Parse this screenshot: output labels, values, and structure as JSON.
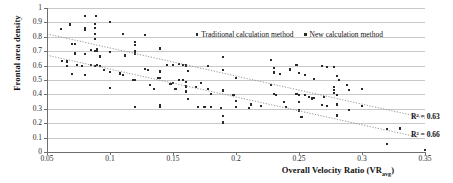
{
  "chart_data": {
    "type": "scatter",
    "title": "",
    "xlabel": "Overall Velocity Ratio (VR",
    "xlabel_sub": "avg",
    "xlabel_tail": ")",
    "ylabel": "Frontal area density",
    "xlim": [
      0.05,
      0.35
    ],
    "ylim": [
      0,
      1
    ],
    "xticks": [
      0.05,
      0.1,
      0.15,
      0.2,
      0.25,
      0.3,
      0.35
    ],
    "xtick_labels": [
      "0.05",
      "0.1",
      "0.15",
      "0.2",
      "0.25",
      "0.3",
      "0.35"
    ],
    "yticks": [
      0,
      0.1,
      0.2,
      0.3,
      0.4,
      0.5,
      0.6,
      0.7,
      0.8,
      0.9,
      1
    ],
    "ytick_labels": [
      "0",
      "0.1",
      "0.2",
      "0.3",
      "0.4",
      "0.5",
      "0.6",
      "0.7",
      "0.8",
      "0.9",
      "1"
    ],
    "grid": "horizontal",
    "legend_position": "top-center",
    "marker_color": "#2a2a2a",
    "gridline_color": "#c8c8c8",
    "trendline_color": "#8a8a8a",
    "series": [
      {
        "name": "Traditional calculation method",
        "marker": "square",
        "trendline": {
          "style": "dotted",
          "x_start": 0.05,
          "y_start": 0.82,
          "x_end": 0.35,
          "y_end": 0.235,
          "r_squared_label": "R² = 0.63",
          "r_squared": 0.63
        },
        "points": [
          [
            0.061,
            0.855
          ],
          [
            0.066,
            0.628
          ],
          [
            0.068,
            0.885
          ],
          [
            0.07,
            0.75
          ],
          [
            0.072,
            0.749
          ],
          [
            0.074,
            0.603
          ],
          [
            0.08,
            0.945
          ],
          [
            0.08,
            0.86
          ],
          [
            0.08,
            0.851
          ],
          [
            0.08,
            0.678
          ],
          [
            0.085,
            0.709
          ],
          [
            0.088,
            0.888
          ],
          [
            0.088,
            0.862
          ],
          [
            0.088,
            0.82
          ],
          [
            0.088,
            0.785
          ],
          [
            0.089,
            0.944
          ],
          [
            0.09,
            0.718
          ],
          [
            0.09,
            0.704
          ],
          [
            0.092,
            0.663
          ],
          [
            0.1,
            0.9
          ],
          [
            0.1,
            0.695
          ],
          [
            0.11,
            0.818
          ],
          [
            0.112,
            0.67
          ],
          [
            0.12,
            0.762
          ],
          [
            0.12,
            0.745
          ],
          [
            0.12,
            0.702
          ],
          [
            0.12,
            0.688
          ],
          [
            0.12,
            0.679
          ],
          [
            0.128,
            0.812
          ],
          [
            0.14,
            0.725
          ],
          [
            0.14,
            0.713
          ],
          [
            0.145,
            0.604
          ],
          [
            0.15,
            0.603
          ],
          [
            0.155,
            0.611
          ],
          [
            0.158,
            0.606
          ],
          [
            0.16,
            0.605
          ],
          [
            0.16,
            0.6
          ],
          [
            0.162,
            0.563
          ],
          [
            0.178,
            0.596
          ],
          [
            0.19,
            0.66
          ],
          [
            0.19,
            0.572
          ],
          [
            0.2,
            0.513
          ],
          [
            0.228,
            0.64
          ],
          [
            0.23,
            0.586
          ],
          [
            0.23,
            0.552
          ],
          [
            0.235,
            0.543
          ],
          [
            0.243,
            0.573
          ],
          [
            0.248,
            0.604
          ],
          [
            0.25,
            0.548
          ],
          [
            0.255,
            0.536
          ],
          [
            0.262,
            0.505
          ],
          [
            0.268,
            0.595
          ],
          [
            0.272,
            0.588
          ],
          [
            0.278,
            0.59
          ],
          [
            0.28,
            0.53
          ],
          [
            0.282,
            0.498
          ],
          [
            0.288,
            0.466
          ],
          [
            0.29,
            0.432
          ],
          [
            0.3,
            0.437
          ]
        ]
      },
      {
        "name": "New calculation method",
        "marker": "square",
        "trendline": {
          "style": "dotted",
          "x_start": 0.05,
          "y_start": 0.672,
          "x_end": 0.345,
          "y_end": 0.102,
          "r_squared_label": "R² = 0.66",
          "r_squared": 0.66
        },
        "points": [
          [
            0.062,
            0.63
          ],
          [
            0.066,
            0.6
          ],
          [
            0.07,
            0.748
          ],
          [
            0.07,
            0.542
          ],
          [
            0.072,
            0.684
          ],
          [
            0.078,
            0.596
          ],
          [
            0.08,
            0.535
          ],
          [
            0.085,
            0.604
          ],
          [
            0.088,
            0.702
          ],
          [
            0.088,
            0.6
          ],
          [
            0.09,
            0.7
          ],
          [
            0.09,
            0.604
          ],
          [
            0.092,
            0.6
          ],
          [
            0.095,
            0.572
          ],
          [
            0.1,
            0.557
          ],
          [
            0.1,
            0.445
          ],
          [
            0.108,
            0.545
          ],
          [
            0.11,
            0.535
          ],
          [
            0.118,
            0.5
          ],
          [
            0.12,
            0.688
          ],
          [
            0.12,
            0.5
          ],
          [
            0.12,
            0.498
          ],
          [
            0.12,
            0.312
          ],
          [
            0.128,
            0.575
          ],
          [
            0.13,
            0.568
          ],
          [
            0.132,
            0.463
          ],
          [
            0.135,
            0.436
          ],
          [
            0.138,
            0.515
          ],
          [
            0.14,
            0.562
          ],
          [
            0.14,
            0.555
          ],
          [
            0.14,
            0.513
          ],
          [
            0.14,
            0.325
          ],
          [
            0.14,
            0.312
          ],
          [
            0.148,
            0.47
          ],
          [
            0.15,
            0.478
          ],
          [
            0.152,
            0.436
          ],
          [
            0.155,
            0.502
          ],
          [
            0.158,
            0.5
          ],
          [
            0.16,
            0.485
          ],
          [
            0.16,
            0.455
          ],
          [
            0.16,
            0.42
          ],
          [
            0.162,
            0.368
          ],
          [
            0.168,
            0.452
          ],
          [
            0.17,
            0.31
          ],
          [
            0.172,
            0.478
          ],
          [
            0.175,
            0.312
          ],
          [
            0.178,
            0.438
          ],
          [
            0.18,
            0.405
          ],
          [
            0.18,
            0.312
          ],
          [
            0.188,
            0.307
          ],
          [
            0.19,
            0.427
          ],
          [
            0.19,
            0.252
          ],
          [
            0.19,
            0.205
          ],
          [
            0.198,
            0.398
          ],
          [
            0.2,
            0.355
          ],
          [
            0.2,
            0.312
          ],
          [
            0.21,
            0.303
          ],
          [
            0.212,
            0.33
          ],
          [
            0.22,
            0.318
          ],
          [
            0.228,
            0.467
          ],
          [
            0.23,
            0.402
          ],
          [
            0.232,
            0.398
          ],
          [
            0.238,
            0.345
          ],
          [
            0.24,
            0.312
          ],
          [
            0.248,
            0.403
          ],
          [
            0.25,
            0.395
          ],
          [
            0.25,
            0.345
          ],
          [
            0.25,
            0.29
          ],
          [
            0.25,
            0.282
          ],
          [
            0.252,
            0.243
          ],
          [
            0.255,
            0.398
          ],
          [
            0.258,
            0.382
          ],
          [
            0.26,
            0.375
          ],
          [
            0.26,
            0.37
          ],
          [
            0.262,
            0.375
          ],
          [
            0.268,
            0.325
          ],
          [
            0.27,
            0.382
          ],
          [
            0.272,
            0.318
          ],
          [
            0.278,
            0.452
          ],
          [
            0.278,
            0.428
          ],
          [
            0.278,
            0.412
          ],
          [
            0.28,
            0.395
          ],
          [
            0.28,
            0.33
          ],
          [
            0.28,
            0.255
          ],
          [
            0.28,
            0.248
          ],
          [
            0.29,
            0.29
          ],
          [
            0.3,
            0.318
          ],
          [
            0.32,
            0.158
          ],
          [
            0.32,
            0.055
          ],
          [
            0.33,
            0.163
          ],
          [
            0.35,
            0.012
          ]
        ]
      }
    ]
  },
  "legend": {
    "items": [
      {
        "label": "Traditional calculation method"
      },
      {
        "label": "New calculation method"
      }
    ]
  },
  "annotations": {
    "r2_traditional": "R² = 0.63",
    "r2_new": "R² = 0.66"
  }
}
